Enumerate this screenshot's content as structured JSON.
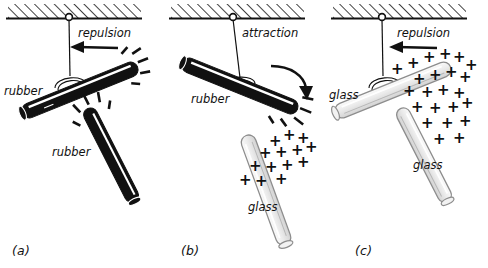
{
  "figure": {
    "background": "#ffffff",
    "ink": "#111111",
    "rubber_color": "#111111",
    "glass_color": "#e9e9e9",
    "glass_outline": "#8d8d8d",
    "highlight_color": "#ffffff"
  },
  "panels": [
    {
      "caption": "(a)",
      "force_label": "repulsion",
      "arrow": "straight-left",
      "hanging_rod": {
        "material": "rubber",
        "label": "rubber",
        "charge": "minus",
        "charge_glyph": "−"
      },
      "hand_rod": {
        "material": "rubber",
        "label": "rubber",
        "charge": "minus",
        "charge_glyph": "−"
      }
    },
    {
      "caption": "(b)",
      "force_label": "attraction",
      "arrow": "curved-down-right",
      "hanging_rod": {
        "material": "rubber",
        "label": "rubber",
        "charge": "minus",
        "charge_glyph": "−"
      },
      "hand_rod": {
        "material": "glass",
        "label": "glass",
        "charge": "plus",
        "charge_glyph": "+"
      }
    },
    {
      "caption": "(c)",
      "force_label": "repulsion",
      "arrow": "straight-left",
      "hanging_rod": {
        "material": "glass",
        "label": "glass",
        "charge": "plus",
        "charge_glyph": "+"
      },
      "hand_rod": {
        "material": "glass",
        "label": "glass",
        "charge": "plus",
        "charge_glyph": "+"
      }
    }
  ],
  "ceiling": {
    "name": "hatched ceiling",
    "hatch_angle_deg": 45
  }
}
